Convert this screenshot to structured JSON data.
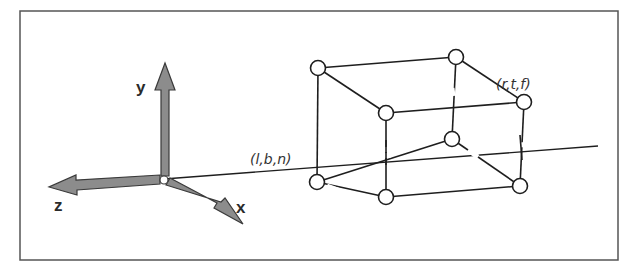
{
  "figure": {
    "type": "view-volume-diagram",
    "frame": {
      "x": 20,
      "y": 11,
      "width": 598,
      "height": 249,
      "stroke": "#555555"
    },
    "colors": {
      "line": "#1e1e1e",
      "arrow_fill": "#8c8c8c",
      "arrow_stroke": "#3a3a3a",
      "vertex_fill": "#ffffff",
      "frame": "#555555"
    },
    "axes": {
      "origin": [
        164,
        179
      ],
      "items": [
        {
          "name": "y",
          "label": "y",
          "tip": [
            165,
            63
          ],
          "label_pos": [
            136,
            93
          ]
        },
        {
          "name": "z",
          "label": "z",
          "tip": [
            49,
            187
          ],
          "label_pos": [
            54,
            211
          ]
        },
        {
          "name": "x",
          "label": "x",
          "tip": [
            243,
            224
          ],
          "label_pos": [
            236,
            213
          ]
        }
      ]
    },
    "projection_line": {
      "from": [
        164,
        179
      ],
      "to": [
        598,
        146
      ]
    },
    "box": {
      "vertices": {
        "back_top_left": [
          318,
          68
        ],
        "back_top_right": [
          456,
          57
        ],
        "front_top_left": [
          386,
          113
        ],
        "front_top_right": [
          524,
          102
        ],
        "back_bottom_left": [
          317,
          182
        ],
        "back_bottom_right": [
          452,
          139
        ],
        "front_bottom_left": [
          386,
          197
        ],
        "front_bottom_right": [
          520,
          186
        ]
      },
      "vertex_radius": 7.5
    },
    "labels": {
      "near_corner": {
        "text": "(l,b,n)",
        "pos": [
          250,
          164
        ]
      },
      "far_corner": {
        "text": "(r,t,f)",
        "pos": [
          496,
          89
        ]
      }
    }
  }
}
